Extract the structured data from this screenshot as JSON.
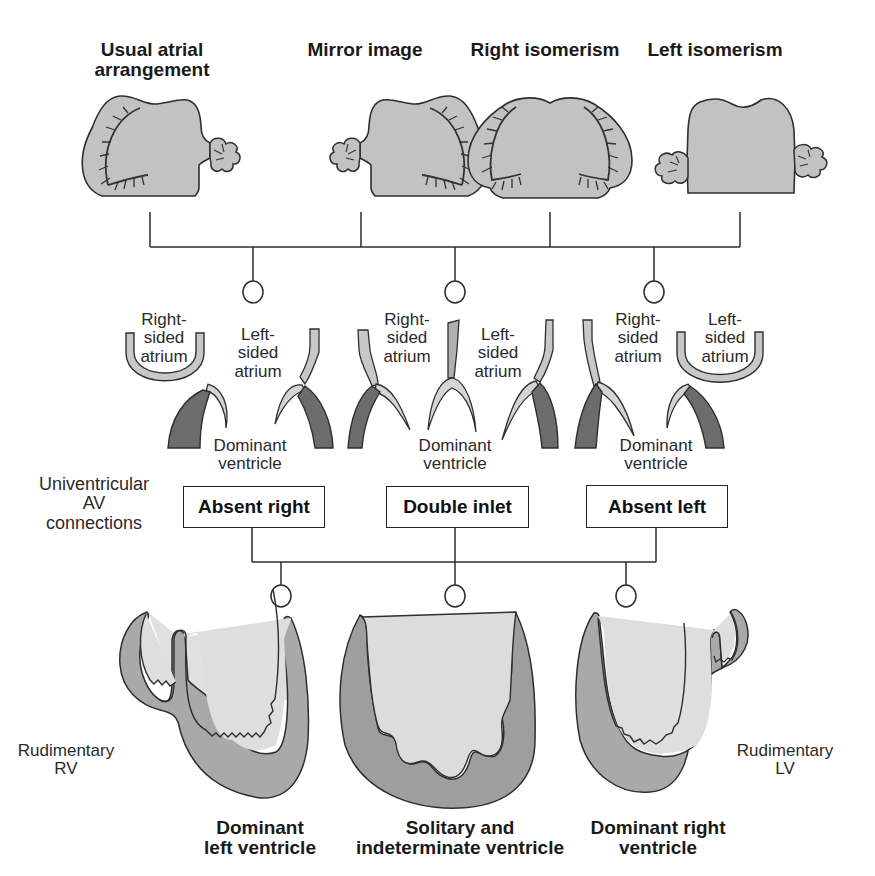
{
  "diagram": {
    "colors": {
      "atrium_fill": "#c4c4c4",
      "atrium_outline": "#333333",
      "atrium_light_wall": "#cfcfcf",
      "ventricle_wall_dark": "#6e6e6e",
      "ventricle_wall_mid": "#a8a8a8",
      "ventricle_cavity": "#dcdcdc",
      "line": "#333333"
    },
    "atrial_arrangements": [
      {
        "label": "Usual atrial arrangement",
        "line1": "Usual atrial",
        "line2": "arrangement"
      },
      {
        "label": "Mirror image"
      },
      {
        "label": "Right isomerism"
      },
      {
        "label": "Left isomerism"
      }
    ],
    "junction_groups": [
      {
        "right_atrium": {
          "line1": "Right-",
          "line2": "sided",
          "line3": "atrium"
        },
        "left_atrium": {
          "line1": "Left-",
          "line2": "sided",
          "line3": "atrium"
        },
        "ventricle": {
          "line1": "Dominant",
          "line2": "ventricle"
        },
        "connection": "Absent right"
      },
      {
        "right_atrium": {
          "line1": "Right-",
          "line2": "sided",
          "line3": "atrium"
        },
        "left_atrium": {
          "line1": "Left-",
          "line2": "sided",
          "line3": "atrium"
        },
        "ventricle": {
          "line1": "Dominant",
          "line2": "ventricle"
        },
        "connection": "Double inlet"
      },
      {
        "right_atrium": {
          "line1": "Right-",
          "line2": "sided",
          "line3": "atrium"
        },
        "left_atrium": {
          "line1": "Left-",
          "line2": "sided",
          "line3": "atrium"
        },
        "ventricle": {
          "line1": "Dominant",
          "line2": "ventricle"
        },
        "connection": "Absent left"
      }
    ],
    "row_label": {
      "line1": "Univentricular",
      "line2": "AV",
      "line3": "connections"
    },
    "ventricular_morphologies": [
      {
        "line1": "Dominant",
        "line2": "left ventricle",
        "rudimentary": {
          "line1": "Rudimentary",
          "line2": "RV"
        }
      },
      {
        "line1": "Solitary and",
        "line2": "indeterminate ventricle"
      },
      {
        "line1": "Dominant right",
        "line2": "ventricle",
        "rudimentary": {
          "line1": "Rudimentary",
          "line2": "LV"
        }
      }
    ]
  }
}
